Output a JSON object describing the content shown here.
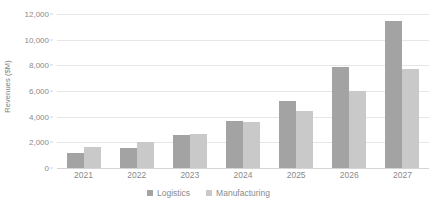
{
  "chart_data": {
    "type": "bar",
    "title": "",
    "xlabel": "",
    "ylabel": "Revenues ($M)",
    "categories": [
      "2021",
      "2022",
      "2023",
      "2024",
      "2025",
      "2026",
      "2027"
    ],
    "series": [
      {
        "name": "Logistics",
        "color": "#a3a3a3",
        "values": [
          1150,
          1550,
          2600,
          3700,
          5250,
          7900,
          11450
        ]
      },
      {
        "name": "Manufacturing",
        "color": "#c9c9c9",
        "values": [
          1600,
          2050,
          2650,
          3550,
          4450,
          6000,
          7750
        ]
      }
    ],
    "ylim": [
      0,
      12000
    ],
    "ytick_labels": [
      "0",
      "2,000",
      "4,000",
      "6,000",
      "8,000",
      "10,000",
      "12,000"
    ],
    "ytick_values": [
      0,
      2000,
      4000,
      6000,
      8000,
      10000,
      12000
    ],
    "grid": true,
    "legend_position": "bottom",
    "gridline_color": "#e6e6e6",
    "axis_color": "#d4d4d4",
    "tick_label_color": "#8a8a8a",
    "background": "#ffffff"
  },
  "legend": {
    "entries": [
      {
        "label": "Logistics",
        "color": "#a3a3a3"
      },
      {
        "label": "Manufacturing",
        "color": "#c9c9c9"
      }
    ]
  }
}
